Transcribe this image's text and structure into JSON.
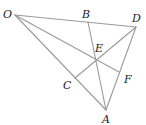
{
  "diagram": {
    "type": "geometry-figure",
    "line_color": "#9a9a9a",
    "label_color": "#222222",
    "points": [
      {
        "name": "O",
        "label": "O",
        "x": 15,
        "y": 15,
        "lx": 3,
        "ly": 18
      },
      {
        "name": "B",
        "label": "B",
        "x": 88,
        "y": 22,
        "lx": 82,
        "ly": 18
      },
      {
        "name": "D",
        "label": "D",
        "x": 136,
        "y": 27,
        "lx": 132,
        "ly": 22
      },
      {
        "name": "E",
        "label": "E",
        "x": 96,
        "y": 61,
        "lx": 95,
        "ly": 52
      },
      {
        "name": "C",
        "label": "C",
        "x": 75,
        "y": 78,
        "lx": 63,
        "ly": 89
      },
      {
        "name": "F",
        "label": "F",
        "x": 119,
        "y": 72,
        "lx": 124,
        "ly": 83
      },
      {
        "name": "A",
        "label": "A",
        "x": 106,
        "y": 110,
        "lx": 102,
        "ly": 123
      }
    ],
    "segments": [
      [
        "O",
        "D"
      ],
      [
        "O",
        "A"
      ],
      [
        "D",
        "A"
      ],
      [
        "O",
        "F"
      ],
      [
        "B",
        "A"
      ],
      [
        "D",
        "C"
      ]
    ]
  }
}
